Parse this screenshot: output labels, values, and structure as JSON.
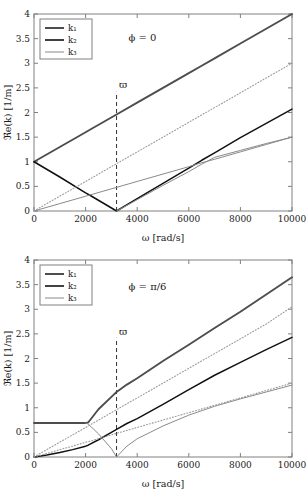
{
  "figure": {
    "panels": [
      {
        "id": "panel-phi-0",
        "annotation": "ϕ = 0",
        "marker_label": "ϖ"
      },
      {
        "id": "panel-phi-pi-6",
        "annotation": "ϕ = π/6",
        "marker_label": "ϖ"
      }
    ],
    "legend": {
      "entries": [
        {
          "label": "k₁",
          "color": "#4d4d4d",
          "width": 2.0
        },
        {
          "label": "k₂",
          "color": "#111111",
          "width": 1.6
        },
        {
          "label": "k₃",
          "color": "#8a8a8a",
          "width": 1.0
        }
      ]
    },
    "axes": {
      "xlabel": "ω [rad/s]",
      "ylabel": "ℜ𝖾(k) [1/m]",
      "xticks": [
        0,
        2000,
        4000,
        6000,
        8000,
        10000
      ],
      "xticklabels": [
        "0",
        "2000",
        "4000",
        "6000",
        "8000",
        "10000"
      ],
      "yticks": [
        0,
        0.5,
        1,
        1.5,
        2,
        2.5,
        3,
        3.5,
        4
      ],
      "yticklabels": [
        "0",
        "0.5",
        "1",
        "1.5",
        "2",
        "2.5",
        "3",
        "3.5",
        "4"
      ],
      "xlim": [
        0,
        10000
      ],
      "ylim": [
        0,
        4
      ]
    }
  },
  "chart_data": [
    {
      "type": "line",
      "title": "ϕ = 0",
      "xlabel": "ω [rad/s]",
      "ylabel": "ℜe(k) [1/m]",
      "xlim": [
        0,
        10000
      ],
      "ylim": [
        0,
        4
      ],
      "grid": false,
      "legend_position": "upper-left",
      "annotations": [
        {
          "text": "ϕ = 0",
          "x": 4200,
          "y": 3.45
        },
        {
          "text": "ϖ",
          "x": 3450,
          "y": 2.5
        }
      ],
      "vertical_markers": [
        {
          "label": "ϖ",
          "x": 3200,
          "style": "dashed"
        }
      ],
      "x": [
        0,
        1000,
        2000,
        2200,
        3200,
        4000,
        5000,
        6000,
        6500,
        7000,
        8000,
        9000,
        10000
      ],
      "series": [
        {
          "name": "k₁",
          "color": "#4d4d4d",
          "style": "solid",
          "values": [
            1.0,
            1.3,
            1.6,
            1.66,
            1.96,
            2.2,
            2.5,
            2.8,
            2.95,
            3.1,
            3.4,
            3.7,
            4.0
          ]
        },
        {
          "name": "k₂",
          "color": "#111111",
          "style": "solid",
          "values": [
            1.0,
            0.69,
            0.37,
            0.31,
            0.0,
            0.25,
            0.56,
            0.87,
            1.03,
            1.18,
            1.49,
            1.78,
            2.07
          ]
        },
        {
          "name": "k₃",
          "color": "#8a8a8a",
          "style": "solid",
          "values": [
            0.0,
            0.15,
            0.3,
            0.33,
            0.48,
            0.6,
            0.75,
            0.9,
            0.98,
            1.05,
            1.2,
            1.35,
            1.5
          ]
        },
        {
          "name": "reference-dotted",
          "color": "#9a9a9a",
          "style": "dotted",
          "values": [
            0.0,
            0.3,
            0.6,
            0.66,
            0.96,
            1.2,
            1.5,
            1.8,
            1.95,
            2.1,
            2.4,
            2.7,
            3.0
          ]
        },
        {
          "name": "k₃-lower-branch",
          "color": "#8a8a8a",
          "style": "solid",
          "values": [
            null,
            null,
            null,
            null,
            0.0,
            0.23,
            0.52,
            0.8,
            0.95,
            1.09,
            1.23,
            1.37,
            1.5
          ]
        }
      ]
    },
    {
      "type": "line",
      "title": "ϕ = π/6",
      "xlabel": "ω [rad/s]",
      "ylabel": "ℜe(k) [1/m]",
      "xlim": [
        0,
        10000
      ],
      "ylim": [
        0,
        4
      ],
      "grid": false,
      "legend_position": "upper-left",
      "annotations": [
        {
          "text": "ϕ = π/6",
          "x": 4400,
          "y": 3.4
        },
        {
          "text": "ϖ",
          "x": 3450,
          "y": 2.48
        }
      ],
      "vertical_markers": [
        {
          "label": "ϖ",
          "x": 3200,
          "style": "dashed"
        }
      ],
      "x": [
        0,
        500,
        1000,
        1500,
        2000,
        2100,
        2500,
        3000,
        3200,
        3600,
        4000,
        5000,
        6000,
        7000,
        8000,
        9000,
        10000
      ],
      "series": [
        {
          "name": "k₁",
          "color": "#4d4d4d",
          "style": "solid",
          "values": [
            0.69,
            0.69,
            0.69,
            0.69,
            0.69,
            0.7,
            0.97,
            1.22,
            1.32,
            1.47,
            1.6,
            1.95,
            2.28,
            2.62,
            2.95,
            3.3,
            3.65
          ]
        },
        {
          "name": "k₂",
          "color": "#111111",
          "style": "solid",
          "values": [
            0.0,
            0.04,
            0.09,
            0.15,
            0.22,
            0.24,
            0.35,
            0.5,
            0.56,
            0.68,
            0.78,
            1.07,
            1.37,
            1.66,
            1.92,
            2.18,
            2.43
          ]
        },
        {
          "name": "k₃",
          "color": "#8a8a8a",
          "style": "solid",
          "values": [
            null,
            null,
            null,
            null,
            0.69,
            0.67,
            0.47,
            0.17,
            0.0,
            0.22,
            0.37,
            0.63,
            0.85,
            1.03,
            1.18,
            1.32,
            1.46
          ]
        },
        {
          "name": "reference-dotted-upper",
          "color": "#9a9a9a",
          "style": "dotted",
          "values": [
            0.0,
            0.15,
            0.3,
            0.45,
            0.6,
            0.63,
            0.75,
            0.9,
            0.96,
            1.08,
            1.2,
            1.5,
            1.8,
            2.1,
            2.4,
            2.7,
            3.05
          ]
        },
        {
          "name": "reference-dotted-lower",
          "color": "#9a9a9a",
          "style": "dotted",
          "values": [
            0.0,
            0.07,
            0.15,
            0.22,
            0.3,
            0.31,
            0.37,
            0.45,
            0.48,
            0.54,
            0.6,
            0.75,
            0.9,
            1.05,
            1.2,
            1.35,
            1.5
          ]
        }
      ]
    }
  ]
}
